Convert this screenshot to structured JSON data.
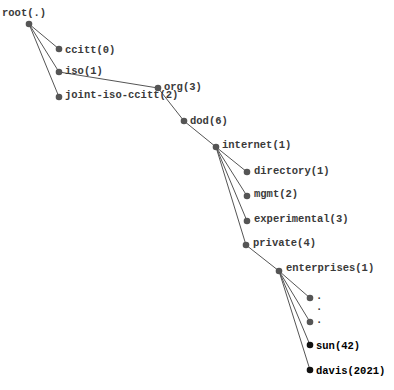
{
  "diagram": {
    "title": "",
    "type": "tree",
    "nodes": [
      {
        "id": "root",
        "label": "root(.)",
        "x": 29,
        "y": 24,
        "label_dx": -27,
        "label_dy": -8,
        "style": "normal"
      },
      {
        "id": "ccitt",
        "label": "ccitt(0)",
        "x": 59,
        "y": 49,
        "label_dx": 6,
        "label_dy": 4,
        "style": "normal"
      },
      {
        "id": "iso",
        "label": "iso(1)",
        "x": 59,
        "y": 72,
        "label_dx": 6,
        "label_dy": 2,
        "style": "normal"
      },
      {
        "id": "joint",
        "label": "joint-iso-ccitt(2)",
        "x": 59,
        "y": 97,
        "label_dx": 6,
        "label_dy": 1,
        "style": "normal"
      },
      {
        "id": "org",
        "label": "org(3)",
        "x": 158,
        "y": 88,
        "label_dx": 6,
        "label_dy": 2,
        "style": "normal"
      },
      {
        "id": "dod",
        "label": "dod(6)",
        "x": 184,
        "y": 121,
        "label_dx": 6,
        "label_dy": 3,
        "style": "normal"
      },
      {
        "id": "internet",
        "label": "internet(1)",
        "x": 216,
        "y": 147,
        "label_dx": 6,
        "label_dy": 1,
        "style": "normal"
      },
      {
        "id": "directory",
        "label": "directory(1)",
        "x": 247,
        "y": 172,
        "label_dx": 7,
        "label_dy": 2,
        "style": "normal"
      },
      {
        "id": "mgmt",
        "label": "mgmt(2)",
        "x": 247,
        "y": 196,
        "label_dx": 7,
        "label_dy": 1,
        "style": "normal"
      },
      {
        "id": "experimental",
        "label": "experimental(3)",
        "x": 247,
        "y": 221,
        "label_dx": 7,
        "label_dy": 1,
        "style": "normal"
      },
      {
        "id": "private",
        "label": "private(4)",
        "x": 246,
        "y": 245,
        "label_dx": 7,
        "label_dy": 1,
        "style": "normal"
      },
      {
        "id": "enterprises",
        "label": "enterprises(1)",
        "x": 279,
        "y": 271,
        "label_dx": 7,
        "label_dy": 0,
        "style": "normal"
      },
      {
        "id": "ellipsis1",
        "label": ".",
        "x": 310,
        "y": 298,
        "label_dx": 6,
        "label_dy": 1,
        "style": "normal"
      },
      {
        "id": "ellipsis-mid",
        "label": ".",
        "x": null,
        "y": 310,
        "label_dx": 0,
        "label_dy": 0,
        "style": "text-only",
        "text_x": 316
      },
      {
        "id": "ellipsis2",
        "label": ".",
        "x": 310,
        "y": 322,
        "label_dx": 6,
        "label_dy": 1,
        "style": "normal"
      },
      {
        "id": "sun",
        "label": "sun(42)",
        "x": 310,
        "y": 345,
        "label_dx": 6,
        "label_dy": 4,
        "style": "strong"
      },
      {
        "id": "davis",
        "label": "davis(2021)",
        "x": 310,
        "y": 370,
        "label_dx": 6,
        "label_dy": 4,
        "style": "strong"
      }
    ],
    "edges": [
      [
        "root",
        "ccitt"
      ],
      [
        "root",
        "iso"
      ],
      [
        "root",
        "joint"
      ],
      [
        "iso",
        "org"
      ],
      [
        "org",
        "dod"
      ],
      [
        "dod",
        "internet"
      ],
      [
        "internet",
        "directory"
      ],
      [
        "internet",
        "mgmt"
      ],
      [
        "internet",
        "experimental"
      ],
      [
        "internet",
        "private"
      ],
      [
        "private",
        "enterprises"
      ],
      [
        "enterprises",
        "ellipsis1"
      ],
      [
        "enterprises",
        "ellipsis2"
      ],
      [
        "enterprises",
        "sun"
      ],
      [
        "enterprises",
        "davis"
      ]
    ],
    "colors": {
      "edge": "#555555",
      "node": "#555555",
      "node_strong": "#111111",
      "label": "#3a3a3a",
      "label_strong": "#000000"
    }
  }
}
